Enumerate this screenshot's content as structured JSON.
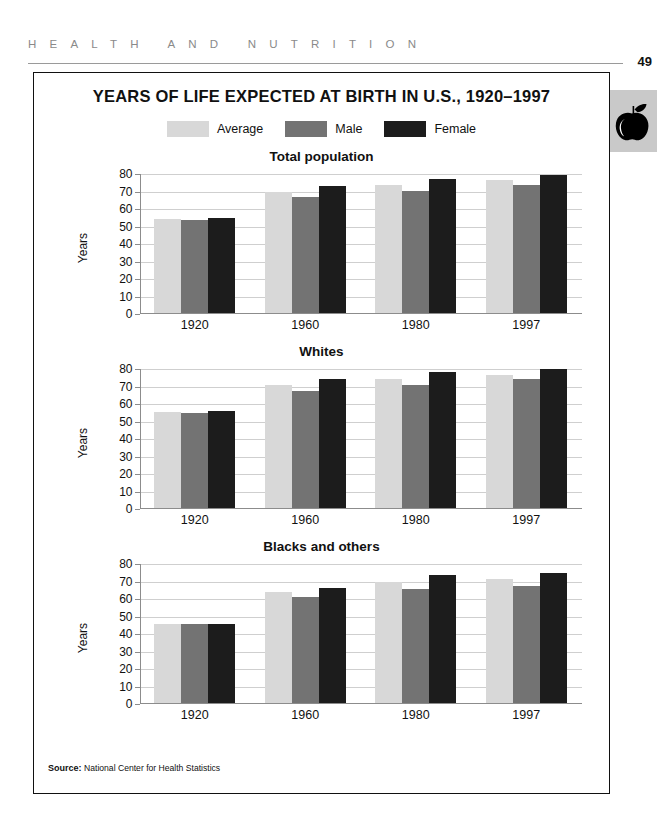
{
  "page": {
    "running_head": "HEALTH AND NUTRITION",
    "folio": "49",
    "tab_icon": "apple-icon"
  },
  "figure": {
    "title": "YEARS OF LIFE EXPECTED AT BIRTH IN U.S., 1920–1997",
    "source_label": "Source:",
    "source_text": "National Center for Health Statistics"
  },
  "legend": {
    "items": [
      {
        "label": "Average",
        "color": "#d8d8d8"
      },
      {
        "label": "Male",
        "color": "#737373"
      },
      {
        "label": "Female",
        "color": "#1c1c1c"
      }
    ]
  },
  "colors": {
    "average": "#d8d8d8",
    "male": "#737373",
    "female": "#1c1c1c",
    "axis": "#8c8c8c",
    "grid": "#cfcfcf",
    "frame": "#111111",
    "tab_bg": "#c9c9c9"
  },
  "axis": {
    "ylabel": "Years",
    "yticks": [
      80,
      70,
      60,
      50,
      40,
      30,
      20,
      10,
      0
    ],
    "ylim": [
      0,
      80
    ],
    "categories": [
      "1920",
      "1960",
      "1980",
      "1997"
    ]
  },
  "chart_data": [
    {
      "type": "bar",
      "title": "Total population",
      "xlabel": "",
      "ylabel": "Years",
      "ylim": [
        0,
        80
      ],
      "grid": true,
      "legend_position": "top-center",
      "categories": [
        "1920",
        "1960",
        "1980",
        "1997"
      ],
      "series": [
        {
          "name": "Average",
          "color": "#d8d8d8",
          "values": [
            54.1,
            69.7,
            73.7,
            76.5
          ]
        },
        {
          "name": "Male",
          "color": "#737373",
          "values": [
            53.6,
            66.6,
            70.0,
            73.6
          ]
        },
        {
          "name": "Female",
          "color": "#1c1c1c",
          "values": [
            54.6,
            73.1,
            77.4,
            79.4
          ]
        }
      ]
    },
    {
      "type": "bar",
      "title": "Whites",
      "xlabel": "",
      "ylabel": "Years",
      "ylim": [
        0,
        80
      ],
      "grid": true,
      "legend_position": "top-center",
      "categories": [
        "1920",
        "1960",
        "1980",
        "1997"
      ],
      "series": [
        {
          "name": "Average",
          "color": "#d8d8d8",
          "values": [
            54.9,
            70.6,
            74.4,
            76.8
          ]
        },
        {
          "name": "Male",
          "color": "#737373",
          "values": [
            54.4,
            67.4,
            70.7,
            74.3
          ]
        },
        {
          "name": "Female",
          "color": "#1c1c1c",
          "values": [
            55.6,
            74.1,
            78.1,
            79.9
          ]
        }
      ]
    },
    {
      "type": "bar",
      "title": "Blacks and others",
      "xlabel": "",
      "ylabel": "Years",
      "ylim": [
        0,
        80
      ],
      "grid": true,
      "legend_position": "top-center",
      "categories": [
        "1920",
        "1960",
        "1980",
        "1997"
      ],
      "series": [
        {
          "name": "Average",
          "color": "#d8d8d8",
          "values": [
            45.3,
            63.6,
            69.5,
            71.1
          ]
        },
        {
          "name": "Male",
          "color": "#737373",
          "values": [
            45.5,
            61.1,
            65.3,
            67.2
          ]
        },
        {
          "name": "Female",
          "color": "#1c1c1c",
          "values": [
            45.2,
            66.3,
            73.6,
            74.7
          ]
        }
      ]
    }
  ]
}
